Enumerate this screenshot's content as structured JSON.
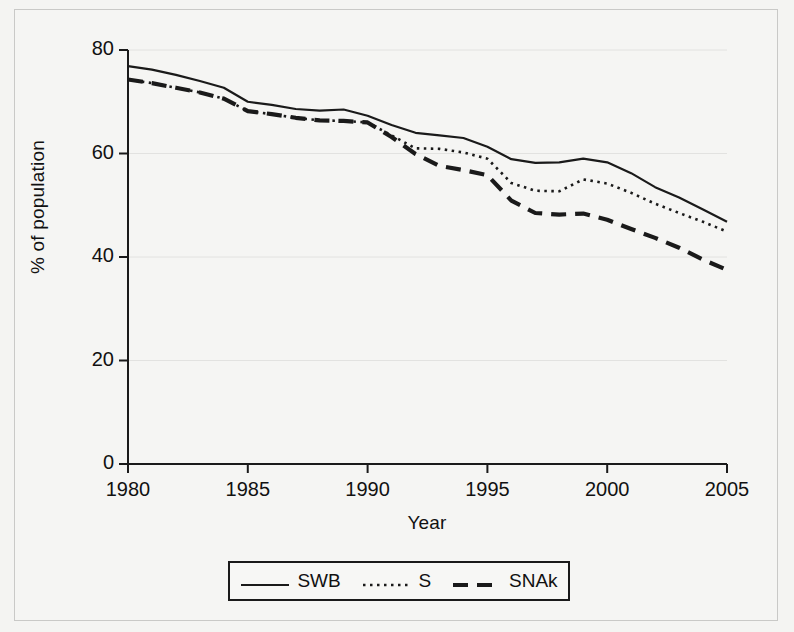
{
  "chart_data": {
    "type": "line",
    "title": "",
    "xlabel": "Year",
    "ylabel": "% of population",
    "xlim": [
      1980,
      2005
    ],
    "ylim": [
      0,
      80
    ],
    "xticks": [
      "1980",
      "1985",
      "1990",
      "1995",
      "2000",
      "2005"
    ],
    "yticks": [
      "0",
      "20",
      "40",
      "60",
      "80"
    ],
    "grid": "horizontal-only",
    "legend_position": "below-axes",
    "x": [
      1980,
      1981,
      1982,
      1983,
      1984,
      1985,
      1986,
      1987,
      1988,
      1989,
      1990,
      1991,
      1992,
      1993,
      1994,
      1995,
      1996,
      1997,
      1998,
      1999,
      2000,
      2001,
      2002,
      2003,
      2004,
      2005
    ],
    "series": [
      {
        "name": "SWB",
        "style": "solid",
        "color": "#1a1a1a",
        "values": [
          76.9,
          76.2,
          75.2,
          74.0,
          72.7,
          70.0,
          69.4,
          68.6,
          68.3,
          68.5,
          67.3,
          65.5,
          64.0,
          63.5,
          63.0,
          61.3,
          58.9,
          58.2,
          58.3,
          59.0,
          58.3,
          56.2,
          53.5,
          51.5,
          49.2,
          46.8
        ]
      },
      {
        "name": "S",
        "style": "dotted",
        "color": "#1a1a1a",
        "values": [
          74.3,
          73.6,
          72.7,
          71.8,
          70.6,
          68.2,
          67.6,
          66.9,
          66.4,
          66.3,
          66.0,
          63.5,
          61.0,
          60.9,
          60.2,
          59.0,
          54.3,
          52.8,
          52.7,
          55.0,
          54.2,
          52.4,
          50.3,
          48.5,
          46.8,
          44.9
        ]
      },
      {
        "name": "SNAk",
        "style": "dashed",
        "color": "#1a1a1a",
        "values": [
          74.3,
          73.6,
          72.7,
          71.8,
          70.6,
          68.2,
          67.6,
          66.9,
          66.4,
          66.3,
          66.0,
          63.2,
          59.9,
          57.6,
          56.8,
          55.8,
          50.9,
          48.5,
          48.2,
          48.4,
          47.2,
          45.4,
          43.7,
          41.8,
          39.5,
          37.5
        ]
      }
    ],
    "legend": [
      {
        "label": "SWB",
        "style": "solid"
      },
      {
        "label": "S",
        "style": "dotted"
      },
      {
        "label": "SNAk",
        "style": "dashed"
      }
    ]
  }
}
